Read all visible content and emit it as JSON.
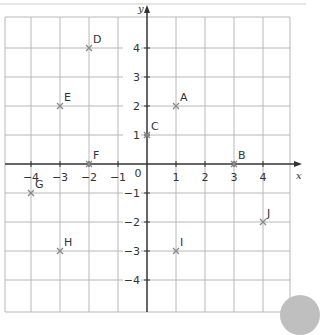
{
  "axes": {
    "x_label": "x",
    "y_label": "y",
    "origin_label": "0",
    "x_ticks": [
      "-4",
      "-3",
      "-2",
      "-1",
      "1",
      "2",
      "3",
      "4"
    ],
    "y_ticks": [
      "4",
      "3",
      "2",
      "1",
      "-1",
      "-2",
      "-3",
      "-4"
    ],
    "x_range": [
      -4.9,
      4.9
    ],
    "y_range": [
      -5,
      5
    ]
  },
  "points": [
    {
      "label": "A",
      "x": 1,
      "y": 2
    },
    {
      "label": "B",
      "x": 3,
      "y": 0
    },
    {
      "label": "C",
      "x": 0,
      "y": 1
    },
    {
      "label": "D",
      "x": -2,
      "y": 4
    },
    {
      "label": "E",
      "x": -3,
      "y": 2
    },
    {
      "label": "F",
      "x": -2,
      "y": 0
    },
    {
      "label": "G",
      "x": -4,
      "y": -1
    },
    {
      "label": "H",
      "x": -3,
      "y": -3
    },
    {
      "label": "I",
      "x": 1,
      "y": -3
    },
    {
      "label": "J",
      "x": 4,
      "y": -2
    }
  ],
  "colors": {
    "grid": "#b8b8b8",
    "axis": "#333333",
    "marker": "#888888",
    "text": "#333333"
  }
}
